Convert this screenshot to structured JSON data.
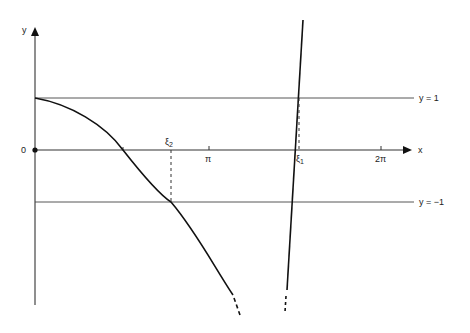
{
  "diagram": {
    "axis_labels": {
      "x": "x",
      "y": "y",
      "origin": "0"
    },
    "ticks": {
      "pi": "π",
      "two_pi": "2π"
    },
    "lines": {
      "upper": "y = 1",
      "lower": "y = −1"
    },
    "roots": {
      "xi2": {
        "base": "ξ",
        "sub": "2"
      },
      "xi1": {
        "base": "ξ",
        "sub": "1"
      }
    },
    "colors": {
      "stroke": "#111111",
      "ref_line": "#444444"
    }
  }
}
